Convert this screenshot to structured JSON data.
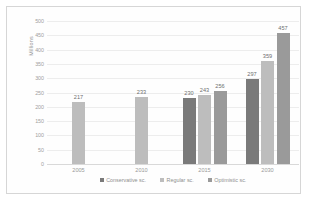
{
  "chart_data": {
    "type": "bar",
    "title": "",
    "xlabel": "",
    "ylabel": "Millions",
    "ylim": [
      0,
      500
    ],
    "ytick_step": 50,
    "yticks": [
      0,
      50,
      100,
      150,
      200,
      250,
      300,
      350,
      400,
      450,
      500
    ],
    "categories": [
      "2005",
      "2010",
      "2015",
      "2030"
    ],
    "grid": true,
    "legend_position": "bottom",
    "series": [
      {
        "name": "Conservative sc.",
        "color": "#7a7a7a",
        "values": [
          null,
          null,
          230,
          297
        ]
      },
      {
        "name": "Regular sc.",
        "color": "#bdbdbd",
        "values": [
          217,
          233,
          243,
          359
        ]
      },
      {
        "name": "Optimistic sc.",
        "color": "#9a9a9a",
        "values": [
          null,
          null,
          256,
          457
        ]
      }
    ],
    "data_labels": [
      "217",
      "233",
      "230",
      "243",
      "256",
      "297",
      "359",
      "457"
    ]
  }
}
